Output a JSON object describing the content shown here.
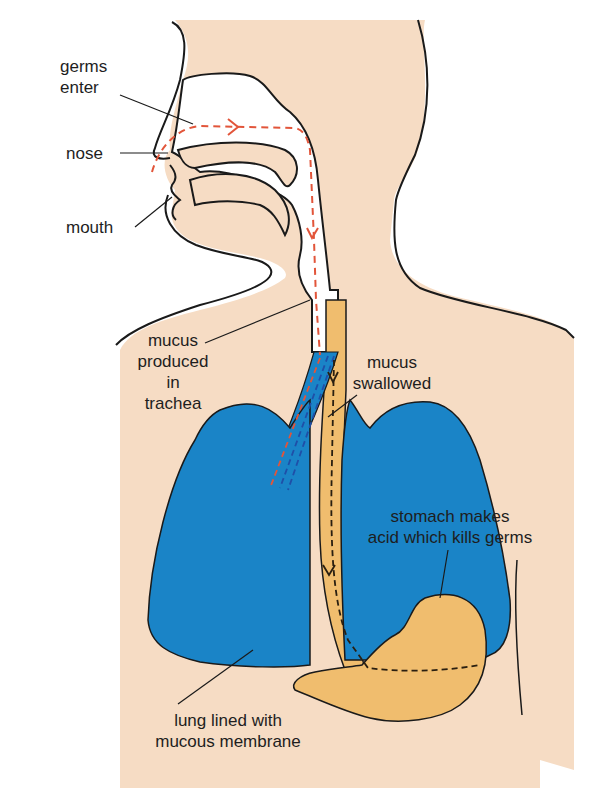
{
  "diagram": {
    "title": "",
    "labels": {
      "germs_enter": "germs\nenter",
      "nose": "nose",
      "mouth": "mouth",
      "mucus_produced": "mucus\nproduced\nin\ntrachea",
      "mucus_swallowed": "mucus\nswallowed",
      "stomach": "stomach makes\nacid which kills germs",
      "lung": "lung lined with\nmucous membrane"
    },
    "colors": {
      "skin": "#f6dcc4",
      "airway": "#ffffff",
      "lung": "#1a84c7",
      "oesophagus_stomach": "#f0bd6e",
      "outline": "#1a1a1a",
      "germ_path": "#e2553a",
      "mucus_path": "#1f4fa8"
    },
    "nodes": [
      {
        "id": "nose",
        "label": "nose"
      },
      {
        "id": "mouth",
        "label": "mouth"
      },
      {
        "id": "trachea",
        "label": "trachea"
      },
      {
        "id": "lungs",
        "label": "lung lined with mucous membrane"
      },
      {
        "id": "oesophagus",
        "label": "mucus swallowed"
      },
      {
        "id": "stomach",
        "label": "stomach makes acid which kills germs"
      }
    ],
    "edges": [
      {
        "from": "nose",
        "to": "trachea",
        "style": "dashed-red",
        "meaning": "germs enter"
      },
      {
        "from": "trachea",
        "to": "lungs",
        "style": "dashed-red-blue"
      },
      {
        "from": "trachea",
        "to": "oesophagus",
        "style": "dashed-black",
        "meaning": "mucus swallowed"
      },
      {
        "from": "oesophagus",
        "to": "stomach",
        "style": "dashed-black"
      }
    ]
  }
}
